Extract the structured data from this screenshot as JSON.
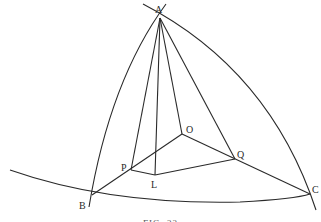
{
  "figure": {
    "caption": "FIG. 22",
    "stroke_color": "#2a2a2a",
    "background": "#ffffff"
  },
  "points": {
    "A": {
      "label": "A",
      "x": 160,
      "y": 18
    },
    "B": {
      "label": "B",
      "x": 92,
      "y": 195
    },
    "C": {
      "label": "C",
      "x": 310,
      "y": 194
    },
    "O": {
      "label": "O",
      "x": 182,
      "y": 134
    },
    "P": {
      "label": "P",
      "x": 131,
      "y": 170
    },
    "Q": {
      "label": "Q",
      "x": 235,
      "y": 159
    },
    "L": {
      "label": "L",
      "x": 155,
      "y": 175
    }
  },
  "labels": {
    "A": "A",
    "B": "B",
    "C": "C",
    "O": "O",
    "P": "P",
    "Q": "Q",
    "L": "L"
  },
  "segments": [
    "A-P",
    "A-L",
    "A-O",
    "A-Q",
    "P-Q-L",
    "B-P",
    "P-O",
    "O-Q",
    "Q-C",
    "P-L",
    "L-Q"
  ],
  "arcs": [
    "A-B (great circle)",
    "A-C (great circle)",
    "B-C (great circle)"
  ]
}
